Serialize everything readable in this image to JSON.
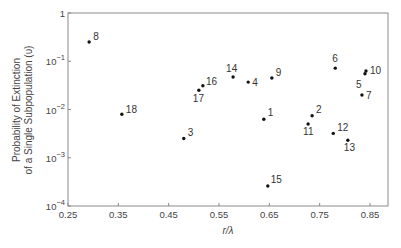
{
  "chart_data": {
    "type": "scatter",
    "title": "",
    "xlabel": "r/λ",
    "ylabel_lines": [
      "Probability of Extinction",
      "of a Single Subpopulation (υ)"
    ],
    "xlim": [
      0.25,
      0.87
    ],
    "ylim": [
      0.0001,
      1
    ],
    "yscale": "log",
    "grid": false,
    "legend": null,
    "x_ticks": [
      0.25,
      0.35,
      0.45,
      0.55,
      0.65,
      0.75,
      0.85
    ],
    "x_tick_labels": [
      "0.25",
      "0.35",
      "0.45",
      "0.55",
      "0.65",
      "0.75",
      "0.85"
    ],
    "y_ticks": [
      1,
      0.1,
      0.01,
      0.001,
      0.0001
    ],
    "y_tick_labels": [
      {
        "base": "1",
        "exp": ""
      },
      {
        "base": "10",
        "exp": "−1"
      },
      {
        "base": "10",
        "exp": "−2"
      },
      {
        "base": "10",
        "exp": "−3"
      },
      {
        "base": "10",
        "exp": "−4"
      }
    ],
    "points": [
      {
        "label": "1",
        "x": 0.639,
        "y": 0.0063,
        "lx": 4,
        "ly": -3
      },
      {
        "label": "2",
        "x": 0.735,
        "y": 0.0074,
        "lx": 4,
        "ly": -3
      },
      {
        "label": "3",
        "x": 0.48,
        "y": 0.0025,
        "lx": 4,
        "ly": -3
      },
      {
        "label": "4",
        "x": 0.608,
        "y": 0.037,
        "lx": 4,
        "ly": 4
      },
      {
        "label": "5",
        "x": 0.84,
        "y": 0.055,
        "lx": -9,
        "ly": 14
      },
      {
        "label": "6",
        "x": 0.781,
        "y": 0.072,
        "lx": -3,
        "ly": -6
      },
      {
        "label": "7",
        "x": 0.834,
        "y": 0.02,
        "lx": 4,
        "ly": 4
      },
      {
        "label": "8",
        "x": 0.292,
        "y": 0.25,
        "lx": 4,
        "ly": -2
      },
      {
        "label": "9",
        "x": 0.655,
        "y": 0.045,
        "lx": 4,
        "ly": -2
      },
      {
        "label": "10",
        "x": 0.842,
        "y": 0.063,
        "lx": 4,
        "ly": 3
      },
      {
        "label": "11",
        "x": 0.727,
        "y": 0.005,
        "lx": -5,
        "ly": 11
      },
      {
        "label": "12",
        "x": 0.777,
        "y": 0.0032,
        "lx": 4,
        "ly": -2
      },
      {
        "label": "13",
        "x": 0.806,
        "y": 0.0023,
        "lx": -4,
        "ly": 11
      },
      {
        "label": "14",
        "x": 0.578,
        "y": 0.047,
        "lx": -7,
        "ly": -5
      },
      {
        "label": "15",
        "x": 0.647,
        "y": 0.00026,
        "lx": 3,
        "ly": -3
      },
      {
        "label": "16",
        "x": 0.518,
        "y": 0.031,
        "lx": 3,
        "ly": -1
      },
      {
        "label": "17",
        "x": 0.51,
        "y": 0.025,
        "lx": -6,
        "ly": 12
      },
      {
        "label": "18",
        "x": 0.357,
        "y": 0.008,
        "lx": 4,
        "ly": -1
      }
    ],
    "colors": {
      "axis": "#8a8a8a",
      "point": "#111111",
      "text": "#444444"
    }
  }
}
